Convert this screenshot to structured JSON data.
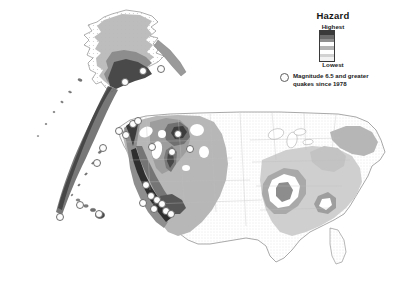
{
  "figure": {
    "kind": "seismic-hazard-map",
    "region": "United States including Alaska and Hawaii",
    "background_color": "#ffffff"
  },
  "legend": {
    "title": "Hazard",
    "highest_label": "Highest",
    "lowest_label": "Lowest",
    "bar_colors": [
      "#3a3a3a",
      "#6b6b6b",
      "#8f8f8f",
      "#ffffff",
      "#b4b4b4",
      "#ffffff",
      "#d2d2d2",
      "#f2f2f2"
    ],
    "quake_marker": {
      "icon": "circle-marker-icon",
      "line1": "Magnitude 6.5 and greater",
      "line2": "quakes since 1978",
      "fill": "#fdfdfd",
      "stroke": "#5d5d5d"
    }
  },
  "chart_data": {
    "type": "heatmap",
    "title": "Hazard",
    "xlabel": "",
    "ylabel": "",
    "legend_position": "top-right",
    "grid": false,
    "colorbar": {
      "label": "Hazard",
      "high_label": "Highest",
      "low_label": "Lowest",
      "levels": [
        "Highest",
        "Very high",
        "High",
        "Moderately high",
        "Moderate",
        "Moderately low",
        "Low",
        "Lowest"
      ],
      "colors": [
        "#3a3a3a",
        "#6b6b6b",
        "#8f8f8f",
        "#ffffff",
        "#b4b4b4",
        "#ffffff",
        "#d2d2d2",
        "#f2f2f2"
      ]
    },
    "series": [
      {
        "name": "Hazard zones",
        "regions": [
          {
            "name": "Pacific coast California",
            "level": "Highest"
          },
          {
            "name": "Cascadia Pacific Northwest coast",
            "level": "Highest"
          },
          {
            "name": "Intermountain West Basin and Range",
            "level": "Moderate"
          },
          {
            "name": "Wasatch Front Utah",
            "level": "High"
          },
          {
            "name": "Yellowstone Intermountain seismic belt",
            "level": "High"
          },
          {
            "name": "Central and Eastern plains",
            "level": "Lowest"
          },
          {
            "name": "New Madrid seismic zone",
            "level": "High"
          },
          {
            "name": "Charleston South Carolina",
            "level": "Moderate"
          },
          {
            "name": "Northeast Appalachian belt",
            "level": "Moderately low"
          },
          {
            "name": "Aleutian Islands arc",
            "level": "Highest"
          },
          {
            "name": "Southern Alaska",
            "level": "Highest"
          },
          {
            "name": "Hawaii",
            "level": "High"
          }
        ]
      },
      {
        "name": "Magnitude 6.5 and greater quakes since 1978",
        "marker": "circle",
        "points": [
          {
            "x": 119,
            "y": 131
          },
          {
            "x": 126,
            "y": 135
          },
          {
            "x": 133,
            "y": 124
          },
          {
            "x": 103,
            "y": 148
          },
          {
            "x": 97,
            "y": 163
          },
          {
            "x": 80,
            "y": 205
          },
          {
            "x": 60,
            "y": 217
          },
          {
            "x": 125,
            "y": 82
          },
          {
            "x": 143,
            "y": 71
          },
          {
            "x": 161,
            "y": 69
          },
          {
            "x": 138,
            "y": 121
          },
          {
            "x": 152,
            "y": 147
          },
          {
            "x": 146,
            "y": 185
          },
          {
            "x": 151,
            "y": 196
          },
          {
            "x": 157,
            "y": 200
          },
          {
            "x": 162,
            "y": 204
          },
          {
            "x": 166,
            "y": 211
          },
          {
            "x": 171,
            "y": 214
          },
          {
            "x": 143,
            "y": 203
          },
          {
            "x": 154,
            "y": 209
          },
          {
            "x": 190,
            "y": 149
          },
          {
            "x": 172,
            "y": 152
          },
          {
            "x": 178,
            "y": 134
          },
          {
            "x": 99,
            "y": 214
          }
        ]
      }
    ]
  }
}
